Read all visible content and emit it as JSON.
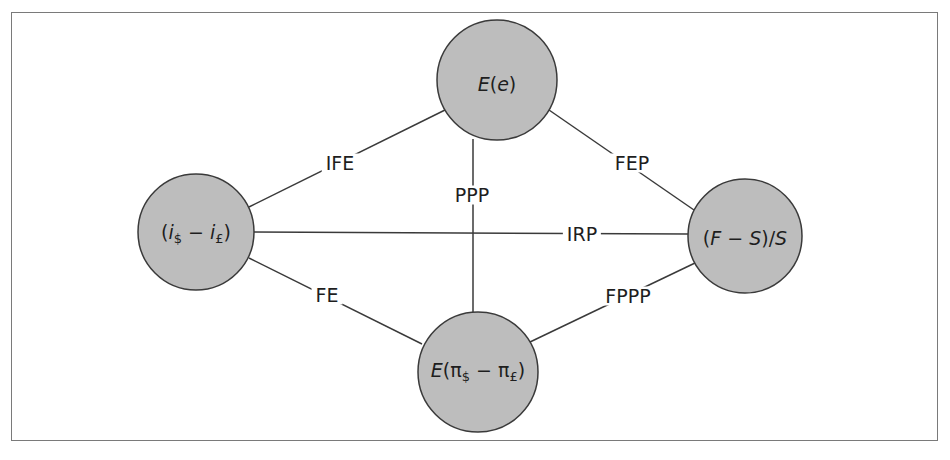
{
  "diagram": {
    "type": "network",
    "title": "",
    "colors": {
      "frame": "#7a7a7a",
      "node_fill": "#bdbdbd",
      "node_stroke": "#3a3a3a",
      "edge": "#3a3a3a",
      "text": "#1e1e1e"
    },
    "nodes": [
      {
        "id": "expected_exchange_rate",
        "label": "E(e)",
        "cx": 497,
        "cy": 80,
        "r": 60
      },
      {
        "id": "interest_differential",
        "label": "(i$ − i£)",
        "cx": 196,
        "cy": 232,
        "r": 58
      },
      {
        "id": "forward_premium",
        "label": "(F − S)/S",
        "cx": 745,
        "cy": 236,
        "r": 57
      },
      {
        "id": "expected_inflation_differential",
        "label": "E(π$ − π£)",
        "cx": 478,
        "cy": 372,
        "r": 60
      }
    ],
    "edges": [
      {
        "from": "expected_exchange_rate",
        "to": "interest_differential",
        "label": "IFE",
        "lx": 340,
        "ly": 163
      },
      {
        "from": "expected_exchange_rate",
        "to": "forward_premium",
        "label": "FEP",
        "lx": 632,
        "ly": 163
      },
      {
        "from": "interest_differential",
        "to": "forward_premium",
        "label": "IRP",
        "lx": 582,
        "ly": 234
      },
      {
        "from": "expected_exchange_rate",
        "to": "expected_inflation_differential",
        "label": "PPP",
        "lx": 472,
        "ly": 195
      },
      {
        "from": "interest_differential",
        "to": "expected_inflation_differential",
        "label": "FE",
        "lx": 327,
        "ly": 295
      },
      {
        "from": "expected_inflation_differential",
        "to": "forward_premium",
        "label": "FPPP",
        "lx": 628,
        "ly": 296
      }
    ]
  }
}
